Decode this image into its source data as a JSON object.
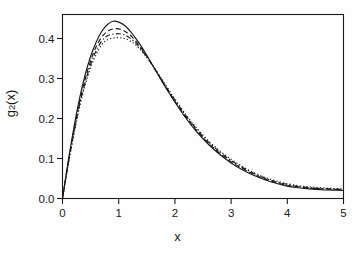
{
  "chart_data": {
    "type": "line",
    "title": "",
    "subtitle": "",
    "xlabel": "x",
    "ylabel": "g2(x)",
    "ylabel_parts": {
      "base": "g",
      "sub": "2",
      "tail": "(x)"
    },
    "xlim": [
      0,
      5
    ],
    "ylim": [
      0,
      0.46
    ],
    "xticks": [
      0,
      1,
      2,
      3,
      4,
      5
    ],
    "xticklabels": [
      "0",
      "1",
      "2",
      "3",
      "4",
      "5"
    ],
    "yticks": [
      0.0,
      0.1,
      0.2,
      0.3,
      0.4
    ],
    "yticklabels": [
      "0.0",
      "0.1",
      "0.2",
      "0.3",
      "0.4"
    ],
    "grid": false,
    "legend": "none",
    "frame": "box",
    "line_color": "#1a1a1a",
    "background": "#fefefe",
    "x": [
      0.0,
      0.1,
      0.2,
      0.3,
      0.4,
      0.5,
      0.6,
      0.7,
      0.8,
      0.9,
      1.0,
      1.1,
      1.2,
      1.3,
      1.4,
      1.5,
      1.6,
      1.7,
      1.8,
      1.9,
      2.0,
      2.2,
      2.4,
      2.6,
      2.8,
      3.0,
      3.2,
      3.4,
      3.6,
      3.8,
      4.0,
      4.2,
      4.4,
      4.6,
      4.8,
      5.0
    ],
    "series": [
      {
        "name": "curve-solid",
        "style": "solid",
        "peak_x": 0.85,
        "peak_y": 0.443,
        "values": [
          0.0,
          0.092,
          0.175,
          0.248,
          0.308,
          0.355,
          0.391,
          0.418,
          0.435,
          0.443,
          0.441,
          0.433,
          0.419,
          0.401,
          0.381,
          0.358,
          0.334,
          0.31,
          0.286,
          0.263,
          0.241,
          0.2,
          0.165,
          0.135,
          0.11,
          0.089,
          0.072,
          0.058,
          0.047,
          0.038,
          0.031,
          0.027,
          0.024,
          0.022,
          0.021,
          0.02
        ]
      },
      {
        "name": "curve-dashed",
        "style": "dashed",
        "peak_x": 0.92,
        "peak_y": 0.425,
        "values": [
          0.0,
          0.088,
          0.168,
          0.239,
          0.297,
          0.344,
          0.38,
          0.404,
          0.418,
          0.424,
          0.424,
          0.419,
          0.409,
          0.394,
          0.376,
          0.355,
          0.333,
          0.31,
          0.287,
          0.265,
          0.243,
          0.203,
          0.168,
          0.138,
          0.113,
          0.092,
          0.075,
          0.061,
          0.049,
          0.04,
          0.033,
          0.029,
          0.026,
          0.024,
          0.023,
          0.022
        ]
      },
      {
        "name": "curve-dotdash",
        "style": "dotdash",
        "peak_x": 0.96,
        "peak_y": 0.412,
        "values": [
          0.0,
          0.085,
          0.163,
          0.232,
          0.289,
          0.335,
          0.37,
          0.394,
          0.407,
          0.411,
          0.412,
          0.409,
          0.401,
          0.389,
          0.373,
          0.354,
          0.333,
          0.311,
          0.289,
          0.267,
          0.246,
          0.206,
          0.171,
          0.141,
          0.116,
          0.095,
          0.078,
          0.063,
          0.051,
          0.042,
          0.035,
          0.03,
          0.027,
          0.025,
          0.024,
          0.023
        ]
      },
      {
        "name": "curve-dotted",
        "style": "dotted",
        "peak_x": 1.0,
        "peak_y": 0.402,
        "values": [
          0.0,
          0.082,
          0.158,
          0.226,
          0.282,
          0.327,
          0.361,
          0.385,
          0.397,
          0.401,
          0.402,
          0.4,
          0.394,
          0.384,
          0.37,
          0.353,
          0.334,
          0.313,
          0.292,
          0.27,
          0.249,
          0.209,
          0.174,
          0.144,
          0.119,
          0.098,
          0.08,
          0.065,
          0.053,
          0.044,
          0.037,
          0.032,
          0.029,
          0.027,
          0.025,
          0.024
        ]
      }
    ]
  }
}
